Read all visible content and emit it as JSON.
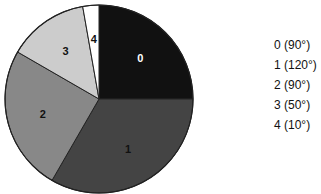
{
  "chart_data": {
    "type": "pie",
    "title": "",
    "start_angle_deg": 0,
    "direction": "clockwise",
    "categories": [
      "0",
      "1",
      "2",
      "3",
      "4"
    ],
    "values": [
      90,
      120,
      90,
      50,
      10
    ],
    "unit": "degrees",
    "slice_labels": [
      "0",
      "1",
      "2",
      "3",
      "4"
    ],
    "colors": [
      "#111111",
      "#444444",
      "#888888",
      "#cccccc",
      "#ffffff"
    ],
    "label_colors": [
      "#ffffff",
      "#111111",
      "#111111",
      "#111111",
      "#111111"
    ],
    "legend": {
      "position": "right",
      "entries": [
        "0 (90°)",
        "1 (120°)",
        "2 (90°)",
        "3 (50°)",
        "4 (10°)"
      ]
    },
    "geometry": {
      "cx": 99,
      "cy": 99,
      "r": 94
    }
  }
}
